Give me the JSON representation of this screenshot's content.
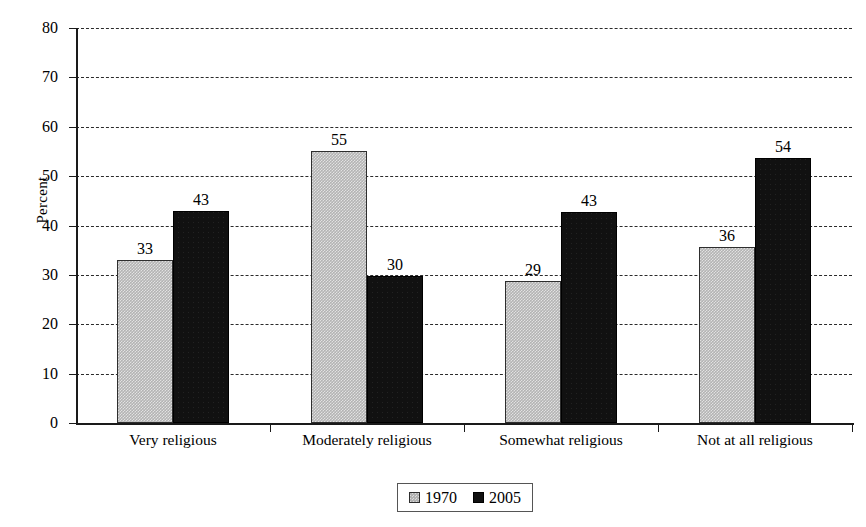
{
  "chart_data": {
    "type": "bar",
    "title": "",
    "xlabel": "",
    "ylabel": "Percent",
    "ylim": [
      0,
      80
    ],
    "ytick_step": 10,
    "yticks": [
      "0",
      "10",
      "20",
      "30",
      "40",
      "50",
      "60",
      "70",
      "80"
    ],
    "grid": true,
    "grid_style": "dashed-horizontal",
    "legend_position": "bottom-center",
    "categories": [
      "Very religious",
      "Moderately religious",
      "Somewhat religious",
      "Not at all religious"
    ],
    "series": [
      {
        "name": "1970",
        "color": "#b3b3b3",
        "values": [
          33,
          55,
          29,
          36
        ],
        "labels": [
          "33",
          "55",
          "29",
          "36"
        ],
        "plotted_values": [
          33.0,
          55.0,
          28.8,
          35.6
        ]
      },
      {
        "name": "2005",
        "color": "#111111",
        "values": [
          43,
          30,
          43,
          54
        ],
        "labels": [
          "43",
          "30",
          "43",
          "54"
        ],
        "plotted_values": [
          43.0,
          29.7,
          42.8,
          53.6
        ]
      }
    ]
  },
  "legend": {
    "items": [
      {
        "label": "1970",
        "swatch": "gray-square-icon"
      },
      {
        "label": "2005",
        "swatch": "black-square-icon"
      }
    ]
  },
  "axes": {
    "y_title": "Percent"
  }
}
